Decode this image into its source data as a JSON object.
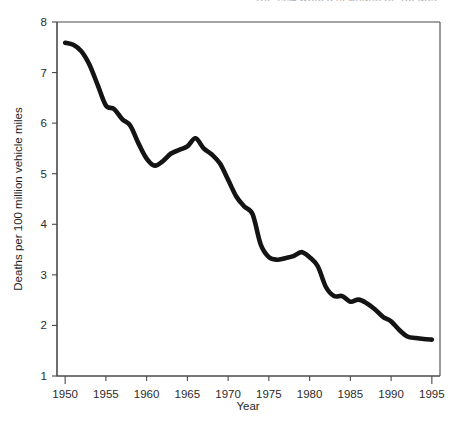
{
  "page": {
    "cropped_header_text": "THE 1994 WORLD ALMANAC OF TRENDS"
  },
  "chart_data": {
    "type": "line",
    "title": "",
    "subtitle": "",
    "xlabel": "Year",
    "ylabel": "Deaths per 100 million vehicle miles",
    "xlim": [
      1949,
      1996
    ],
    "ylim": [
      1,
      8
    ],
    "xticks": [
      1950,
      1955,
      1960,
      1965,
      1970,
      1975,
      1980,
      1985,
      1990,
      1995
    ],
    "xtick_labels": [
      "1950",
      "1955",
      "1960",
      "1965",
      "1970",
      "1975",
      "1980",
      "1985",
      "1990",
      "1995"
    ],
    "yticks": [
      1,
      2,
      3,
      4,
      5,
      6,
      7,
      8
    ],
    "ytick_labels": [
      "1",
      "2",
      "3",
      "4",
      "5",
      "6",
      "7",
      "8"
    ],
    "grid": false,
    "legend": null,
    "legend_position": "none",
    "series": [
      {
        "name": "Motor vehicle death rate",
        "color": "#141414",
        "x": [
          1950,
          1951,
          1952,
          1953,
          1954,
          1955,
          1956,
          1957,
          1958,
          1959,
          1960,
          1961,
          1962,
          1963,
          1964,
          1965,
          1966,
          1967,
          1968,
          1969,
          1970,
          1971,
          1972,
          1973,
          1974,
          1975,
          1976,
          1977,
          1978,
          1979,
          1980,
          1981,
          1982,
          1983,
          1984,
          1985,
          1986,
          1987,
          1988,
          1989,
          1990,
          1991,
          1992,
          1993,
          1994,
          1995
        ],
        "values": [
          7.59,
          7.55,
          7.42,
          7.15,
          6.75,
          6.35,
          6.28,
          6.08,
          5.95,
          5.6,
          5.3,
          5.16,
          5.25,
          5.4,
          5.47,
          5.54,
          5.7,
          5.5,
          5.38,
          5.2,
          4.88,
          4.55,
          4.35,
          4.2,
          3.6,
          3.35,
          3.3,
          3.33,
          3.37,
          3.45,
          3.35,
          3.17,
          2.76,
          2.58,
          2.58,
          2.47,
          2.51,
          2.44,
          2.32,
          2.17,
          2.08,
          1.91,
          1.78,
          1.75,
          1.73,
          1.72
        ]
      }
    ]
  }
}
